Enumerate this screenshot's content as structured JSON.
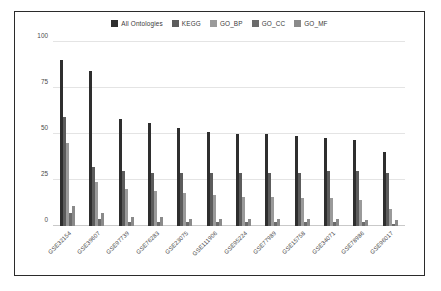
{
  "chart_data": {
    "type": "bar",
    "title": "",
    "xlabel": "",
    "ylabel": "",
    "ylim": [
      0,
      100
    ],
    "yticks": [
      0,
      25,
      50,
      75,
      100
    ],
    "grid": true,
    "legend_position": "top-center",
    "categories": [
      "GSE32154",
      "GSE39607",
      "GSE97739",
      "GSE76283",
      "GSE23075",
      "GSE111906",
      "GSE95224",
      "GSE77989",
      "GSE15758",
      "GSE34071",
      "GSE78986",
      "GSE96017"
    ],
    "series": [
      {
        "name": "All Ontologies",
        "color": "#2e2e2e",
        "values": [
          90,
          84,
          58,
          56,
          53,
          51,
          50,
          50,
          49,
          48,
          47,
          40
        ]
      },
      {
        "name": "KEGG",
        "color": "#5c5c5c",
        "values": [
          59,
          32,
          30,
          29,
          29,
          29,
          29,
          29,
          29,
          30,
          30,
          29
        ]
      },
      {
        "name": "GO_BP",
        "color": "#9a9a9a",
        "values": [
          45,
          24,
          20,
          19,
          18,
          17,
          16,
          16,
          15,
          15,
          14,
          9
        ]
      },
      {
        "name": "GO_CC",
        "color": "#6b6b6b",
        "values": [
          7,
          4,
          2,
          2,
          2,
          2,
          2,
          2,
          2,
          2,
          2,
          1
        ]
      },
      {
        "name": "GO_MF",
        "color": "#8a8a8a",
        "values": [
          11,
          7,
          5,
          5,
          4,
          4,
          4,
          4,
          4,
          4,
          3,
          3
        ]
      }
    ]
  }
}
